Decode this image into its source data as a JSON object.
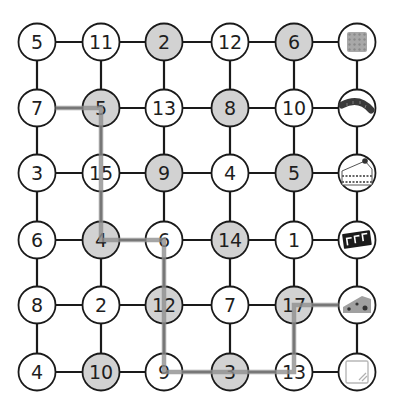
{
  "puzzle": {
    "grid_rows": 6,
    "grid_cols": 6,
    "colors": {
      "line": "#1a1a1a",
      "node_white": "#ffffff",
      "node_gray": "#d2d2d2",
      "node_border": "#1a1a1a",
      "path": "#8e8e8e"
    },
    "rows": [
      [
        {
          "label": "5",
          "shaded": false
        },
        {
          "label": "11",
          "shaded": false
        },
        {
          "label": "2",
          "shaded": true
        },
        {
          "label": "12",
          "shaded": false
        },
        {
          "label": "6",
          "shaded": true
        },
        {
          "icon": "chocolate-bar-icon"
        }
      ],
      [
        {
          "label": "7",
          "shaded": false
        },
        {
          "label": "5",
          "shaded": true
        },
        {
          "label": "13",
          "shaded": false
        },
        {
          "label": "8",
          "shaded": true
        },
        {
          "label": "10",
          "shaded": false
        },
        {
          "icon": "sausage-icon"
        }
      ],
      [
        {
          "label": "3",
          "shaded": false
        },
        {
          "label": "15",
          "shaded": false
        },
        {
          "label": "9",
          "shaded": true
        },
        {
          "label": "4",
          "shaded": false
        },
        {
          "label": "5",
          "shaded": true
        },
        {
          "icon": "cake-slice-icon"
        }
      ],
      [
        {
          "label": "6",
          "shaded": false
        },
        {
          "label": "4",
          "shaded": true
        },
        {
          "label": "6",
          "shaded": false
        },
        {
          "label": "14",
          "shaded": true
        },
        {
          "label": "1",
          "shaded": false
        },
        {
          "icon": "cracker-icon"
        }
      ],
      [
        {
          "label": "8",
          "shaded": false
        },
        {
          "label": "2",
          "shaded": false
        },
        {
          "label": "12",
          "shaded": true
        },
        {
          "label": "7",
          "shaded": false
        },
        {
          "label": "17",
          "shaded": true
        },
        {
          "icon": "cheese-icon"
        }
      ],
      [
        {
          "label": "4",
          "shaded": false
        },
        {
          "label": "10",
          "shaded": true
        },
        {
          "label": "9",
          "shaded": false
        },
        {
          "label": "3",
          "shaded": true
        },
        {
          "label": "13",
          "shaded": false
        },
        {
          "icon": "empty-box-icon"
        }
      ]
    ],
    "path": [
      [
        1,
        0
      ],
      [
        1,
        1
      ],
      [
        3,
        1
      ],
      [
        3,
        2
      ],
      [
        5,
        2
      ],
      [
        5,
        4
      ],
      [
        4,
        4
      ],
      [
        4,
        5
      ]
    ]
  }
}
